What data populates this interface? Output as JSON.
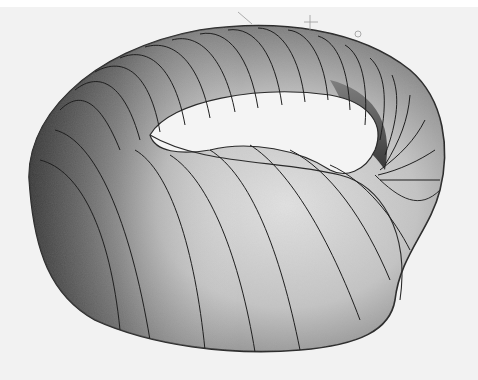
{
  "image": {
    "subject": "pencil drawing of a twisted torus surface",
    "width": 478,
    "height": 380
  },
  "colors": {
    "background": "#f2f2f2",
    "top_band": "#ffffff",
    "outline": "#2a2a2a",
    "shade_dark": "#3a3a3a",
    "shade_mid": "#8a8a8a",
    "shade_light": "#d8d8d8",
    "hole": "#f4f4f4"
  }
}
